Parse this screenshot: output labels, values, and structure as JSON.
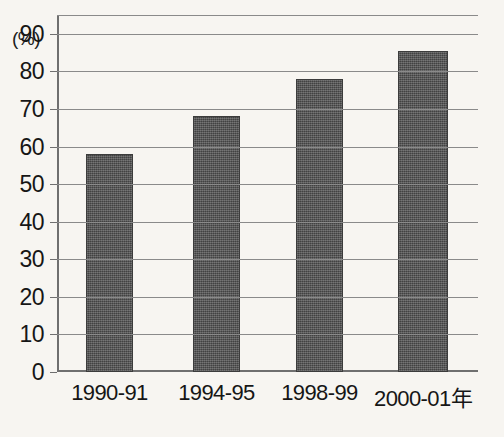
{
  "chart_data": {
    "type": "bar",
    "title": "",
    "subtitle": "",
    "xlabel": "",
    "ylabel": "",
    "unit_label": "(%)",
    "categories": [
      "1990-91",
      "1994-95",
      "1998-99",
      "2000-01年"
    ],
    "values": [
      58,
      68,
      78,
      85.5
    ],
    "series": [
      {
        "name": "",
        "values": [
          58,
          68,
          78,
          85.5
        ]
      }
    ],
    "ylim": [
      0,
      95
    ],
    "yticks": [
      0,
      10,
      20,
      30,
      40,
      50,
      60,
      70,
      80,
      90
    ],
    "ytick_labels": [
      "0",
      "10",
      "20",
      "30",
      "40",
      "50",
      "60",
      "70",
      "80",
      "90"
    ],
    "gridlines": [
      10,
      20,
      30,
      40,
      50,
      60,
      70,
      80,
      90,
      95
    ],
    "grid": true,
    "legend": false,
    "legend_position": "none",
    "annotations": [],
    "bar_color": "#4f4f4f",
    "grid_color": "#8a8a8a",
    "axis_color": "#6f6f6f",
    "background_color": "#f7f5f1",
    "text_color": "#161616"
  }
}
